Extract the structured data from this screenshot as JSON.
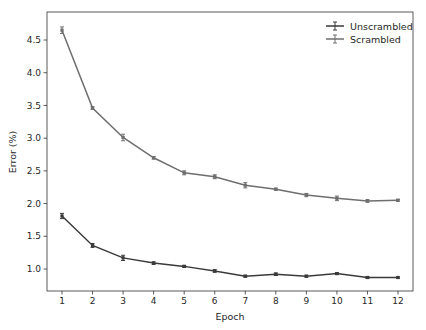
{
  "chart_data": {
    "type": "line",
    "title": "",
    "xlabel": "Epoch",
    "ylabel": "Error (%)",
    "x": [
      1,
      2,
      3,
      4,
      5,
      6,
      7,
      8,
      9,
      10,
      11,
      12
    ],
    "xticks": [
      "1",
      "2",
      "3",
      "4",
      "5",
      "6",
      "7",
      "8",
      "9",
      "10",
      "11",
      "12"
    ],
    "yticks": [
      "1.0",
      "1.5",
      "2.0",
      "2.5",
      "3.0",
      "3.5",
      "4.0",
      "4.5"
    ],
    "ytick_values": [
      1.0,
      1.5,
      2.0,
      2.5,
      3.0,
      3.5,
      4.0,
      4.5
    ],
    "xlim": [
      0.6,
      12.4
    ],
    "ylim": [
      0.65,
      4.8
    ],
    "grid": false,
    "legend_position": "upper right",
    "error_bars": true,
    "series": [
      {
        "name": "Unscrambled",
        "color": "#3a3a3a",
        "values": [
          1.81,
          1.36,
          1.17,
          1.09,
          1.04,
          0.97,
          0.89,
          0.92,
          0.89,
          0.93,
          0.87,
          0.87
        ],
        "errors": [
          0.04,
          0.03,
          0.04,
          0.02,
          0.015,
          0.02,
          0.015,
          0.02,
          0.015,
          0.015,
          0.015,
          0.01
        ]
      },
      {
        "name": "Scrambled",
        "color": "#6e6e6e",
        "values": [
          4.65,
          3.46,
          3.01,
          2.7,
          2.47,
          2.41,
          2.28,
          2.22,
          2.13,
          2.08,
          2.04,
          2.05
        ],
        "errors": [
          0.05,
          0.02,
          0.05,
          0.02,
          0.03,
          0.03,
          0.04,
          0.015,
          0.025,
          0.035,
          0.02,
          0.015
        ]
      }
    ]
  }
}
